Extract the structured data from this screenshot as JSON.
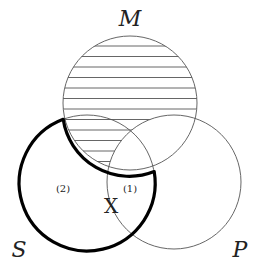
{
  "diagram": {
    "type": "venn",
    "sets": [
      {
        "id": "M",
        "label": "M",
        "cx": 130,
        "cy": 103,
        "r": 67
      },
      {
        "id": "S",
        "label": "S",
        "cx": 87,
        "cy": 183,
        "r": 68
      },
      {
        "id": "P",
        "label": "P",
        "cx": 174,
        "cy": 182,
        "r": 67
      }
    ],
    "shaded_region": "M minus P (horizontal hatching)",
    "bold_outline_region": "S minus M",
    "region_labels": {
      "one": "(1)",
      "two": "(2)"
    },
    "marker": "X",
    "colors": {
      "line": "#555555",
      "bold": "#000000",
      "hatch": "#666666"
    }
  }
}
